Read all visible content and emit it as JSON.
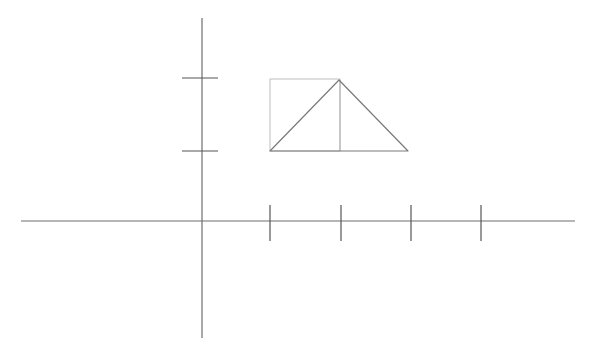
{
  "diagram": {
    "colors": {
      "background": "#ffffff",
      "axis": "#6f6f6f",
      "tick": "#555555",
      "triangle": "#7a7a7a",
      "square": "#bdbdbd",
      "divider": "#b0b0b0"
    },
    "axes": {
      "x_axis": {
        "x1": 21,
        "y1": 221,
        "x2": 575,
        "y2": 221
      },
      "y_axis": {
        "x1": 202,
        "y1": 18,
        "x2": 202,
        "y2": 338
      }
    },
    "x_ticks": [
      {
        "x": 270,
        "y1": 205,
        "y2": 241
      },
      {
        "x": 341,
        "y1": 205,
        "y2": 241
      },
      {
        "x": 411,
        "y1": 205,
        "y2": 241
      },
      {
        "x": 481,
        "y1": 205,
        "y2": 241
      }
    ],
    "y_ticks": [
      {
        "y": 78,
        "x1": 182,
        "x2": 218
      },
      {
        "y": 151,
        "x1": 182,
        "x2": 218
      }
    ],
    "shapes": {
      "square": {
        "x": 270,
        "y": 79,
        "width": 70,
        "height": 72
      },
      "triangle": {
        "points": "270,151 339,80 408,151"
      },
      "divider": {
        "x1": 340,
        "y1": 80,
        "x2": 340,
        "y2": 151
      }
    }
  }
}
